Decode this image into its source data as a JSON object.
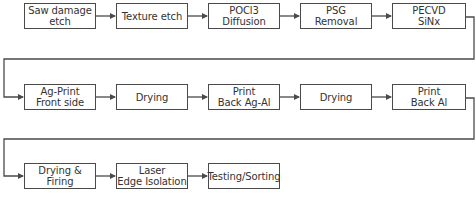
{
  "diagram": {
    "type": "process-flow",
    "rows": [
      {
        "steps": [
          {
            "lines": [
              "Saw damage",
              "etch"
            ]
          },
          {
            "lines": [
              "Texture etch"
            ]
          },
          {
            "lines": [
              "POCl3",
              "Diffusion"
            ]
          },
          {
            "lines": [
              "PSG",
              "Removal"
            ]
          },
          {
            "lines": [
              "PECVD",
              "SiNx"
            ]
          }
        ]
      },
      {
        "steps": [
          {
            "lines": [
              "Ag-Print",
              "Front side"
            ]
          },
          {
            "lines": [
              "Drying"
            ]
          },
          {
            "lines": [
              "Print",
              "Back Ag-Al"
            ]
          },
          {
            "lines": [
              "Drying"
            ]
          },
          {
            "lines": [
              "Print",
              "Back Al"
            ]
          }
        ]
      },
      {
        "steps": [
          {
            "lines": [
              "Drying &",
              "Firing"
            ]
          },
          {
            "lines": [
              "Laser",
              "Edge Isolation"
            ]
          },
          {
            "lines": [
              "Testing/Sorting"
            ]
          }
        ]
      }
    ],
    "colors": {
      "line": "#4a4a4a",
      "text": "#333333",
      "background": "#ffffff"
    }
  }
}
